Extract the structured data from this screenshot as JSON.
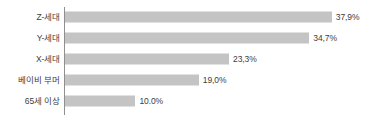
{
  "chart_data": {
    "type": "bar",
    "orientation": "horizontal",
    "title": "",
    "subtitle": "",
    "xlabel": "",
    "ylabel": "",
    "grid": false,
    "legend": null,
    "axis_line": "vertical-category-axis",
    "xlim": [
      0,
      43
    ],
    "categories": [
      "Z-세대",
      "Y-세대",
      "X-세대",
      "베이비 부머",
      "65세 이상"
    ],
    "values": [
      37.9,
      34.7,
      23.3,
      19.0,
      10.0
    ],
    "value_labels": [
      "37,9%",
      "34,7%",
      "23,3%",
      "19,0%",
      "10.0%"
    ],
    "bar_color": "#c4c4c4",
    "axis_color": "#8f8f8f",
    "text_color": "#3d3d3d",
    "background": "#ffffff"
  },
  "rows": [
    {
      "category": "Z-세대",
      "value": 37.9,
      "label": "37,9%"
    },
    {
      "category": "Y-세대",
      "value": 34.7,
      "label": "34,7%"
    },
    {
      "category": "X-세대",
      "value": 23.3,
      "label": "23,3%"
    },
    {
      "category": "베이비 부머",
      "value": 19.0,
      "label": "19,0%"
    },
    {
      "category": "65세 이상",
      "value": 10.0,
      "label": "10.0%"
    }
  ]
}
